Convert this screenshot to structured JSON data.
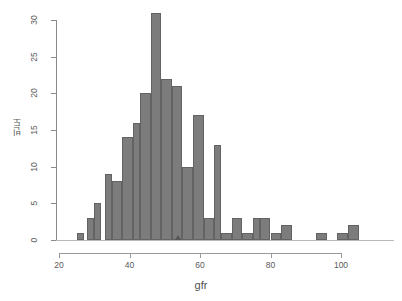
{
  "chart_data": {
    "type": "bar",
    "title": "",
    "subtitle": "",
    "xlabel": "gfr",
    "ylabel": "빈도",
    "xlim": [
      24,
      110
    ],
    "ylim": [
      0,
      31
    ],
    "grid": false,
    "legend": null,
    "bin_width": 2,
    "bin_starts": [
      25,
      27,
      29,
      31,
      33,
      35,
      37,
      39,
      41,
      43,
      45,
      47,
      49,
      51,
      53,
      55,
      57,
      59,
      61,
      63,
      65,
      67,
      69,
      71,
      73,
      75,
      77,
      79,
      81,
      83,
      85,
      87,
      89,
      91,
      93,
      95,
      97,
      99,
      101,
      103,
      105,
      107
    ],
    "values": [
      1,
      0,
      3,
      5,
      0,
      9,
      8,
      0,
      14,
      16,
      20,
      0,
      31,
      22,
      0,
      21,
      10,
      0,
      17,
      3,
      0,
      13,
      1,
      0,
      3,
      1,
      0,
      3,
      3,
      0,
      1,
      2,
      0,
      0,
      0,
      0,
      1,
      0,
      0,
      1,
      2,
      0
    ],
    "bars": [
      {
        "x0": 25,
        "x1": 27,
        "count": 1
      },
      {
        "x0": 28,
        "x1": 30,
        "count": 3
      },
      {
        "x0": 30,
        "x1": 32,
        "count": 5
      },
      {
        "x0": 33,
        "x1": 35,
        "count": 9
      },
      {
        "x0": 35,
        "x1": 38,
        "count": 8
      },
      {
        "x0": 38,
        "x1": 41,
        "count": 14
      },
      {
        "x0": 41,
        "x1": 43,
        "count": 16
      },
      {
        "x0": 43,
        "x1": 46,
        "count": 20
      },
      {
        "x0": 46,
        "x1": 49,
        "count": 31
      },
      {
        "x0": 49,
        "x1": 52,
        "count": 22
      },
      {
        "x0": 52,
        "x1": 55,
        "count": 21
      },
      {
        "x0": 55,
        "x1": 58,
        "count": 10
      },
      {
        "x0": 58,
        "x1": 61,
        "count": 17
      },
      {
        "x0": 61,
        "x1": 64,
        "count": 3
      },
      {
        "x0": 64,
        "x1": 66,
        "count": 13
      },
      {
        "x0": 66,
        "x1": 69,
        "count": 1
      },
      {
        "x0": 69,
        "x1": 72,
        "count": 3
      },
      {
        "x0": 72,
        "x1": 75,
        "count": 1
      },
      {
        "x0": 75,
        "x1": 77,
        "count": 3
      },
      {
        "x0": 77,
        "x1": 80,
        "count": 3
      },
      {
        "x0": 80,
        "x1": 83,
        "count": 1
      },
      {
        "x0": 83,
        "x1": 86,
        "count": 2
      },
      {
        "x0": 93,
        "x1": 96,
        "count": 1
      },
      {
        "x0": 99,
        "x1": 102,
        "count": 1
      },
      {
        "x0": 102,
        "x1": 105,
        "count": 2
      }
    ],
    "x_ticks": [
      20,
      40,
      60,
      80,
      100
    ],
    "x_tick_labels": [
      "20",
      "40",
      "60",
      "80",
      "100"
    ],
    "y_ticks": [
      0,
      5,
      10,
      15,
      20,
      25,
      30
    ],
    "y_tick_labels": [
      "0",
      "5",
      "10",
      "15",
      "20",
      "25",
      "30"
    ],
    "annotations": [
      {
        "name": "mean-marker",
        "shape": "triangle",
        "x": 54,
        "y": 0
      }
    ],
    "colors": {
      "bar_fill": "#7c7c7c",
      "bar_border": "#636363",
      "axis": "#9a9a9a",
      "text": "#5a5a5a",
      "background": "#ffffff",
      "marker": "#555555"
    }
  }
}
